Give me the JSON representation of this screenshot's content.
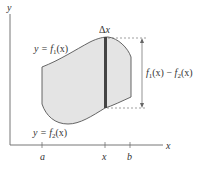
{
  "diagram": {
    "axes": {
      "x_label": "x",
      "y_label": "y",
      "ticks": [
        {
          "label": "a",
          "pos": 42
        },
        {
          "label": "x",
          "pos": 105
        },
        {
          "label": "b",
          "pos": 130
        }
      ]
    },
    "curves": {
      "upper": {
        "label_prefix": "y = ",
        "label_fn": "f",
        "label_sub": "1",
        "label_arg": "(x)"
      },
      "lower": {
        "label_prefix": "y = ",
        "label_fn": "f",
        "label_sub": "2",
        "label_arg": "(x)"
      }
    },
    "strip": {
      "label_delta": "Δ",
      "label_var": "x"
    },
    "height_label": {
      "f1": "f",
      "sub1": "1",
      "arg1": "(x)",
      "minus": " − ",
      "f2": "f",
      "sub2": "2",
      "arg2": "(x)"
    },
    "colors": {
      "fill": "#e4e4e4",
      "stroke": "#555555",
      "strip": "#444444",
      "axis": "#666666"
    }
  }
}
